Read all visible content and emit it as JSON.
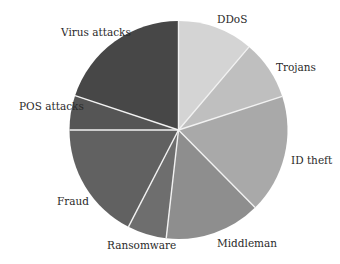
{
  "chart_data": {
    "type": "pie",
    "title": "",
    "start_angle_deg": 0,
    "direction": "clockwise",
    "categories": [
      "DDoS",
      "Trojans",
      "ID theft",
      "Middleman",
      "Ransomware",
      "Fraud",
      "POS attacks",
      "Virus attacks"
    ],
    "values": [
      11.2,
      8.8,
      17.6,
      14.2,
      5.8,
      17.4,
      5.1,
      19.9
    ],
    "colors": [
      "#d4d4d4",
      "#bfbfbf",
      "#a9a9a9",
      "#8e8e8e",
      "#6e6e6e",
      "#616161",
      "#555555",
      "#474747"
    ],
    "legend": "none (labels placed beside slices)"
  },
  "pie": {
    "cx": 178.5,
    "cy": 130,
    "r": 109,
    "separator_color": "#f2f2f2",
    "separator_width": 1.4
  },
  "labels": [
    {
      "text": "DDoS",
      "x": 217,
      "y": 14
    },
    {
      "text": "Trojans",
      "x": 276,
      "y": 62
    },
    {
      "text": "ID theft",
      "x": 291,
      "y": 155
    },
    {
      "text": "Middleman",
      "x": 217,
      "y": 238
    },
    {
      "text": "Ransomware",
      "x": 107,
      "y": 240
    },
    {
      "text": "Fraud",
      "x": 57,
      "y": 196
    },
    {
      "text": "POS attacks",
      "x": 19,
      "y": 101
    },
    {
      "text": "Virus attacks",
      "x": 61,
      "y": 27
    }
  ]
}
